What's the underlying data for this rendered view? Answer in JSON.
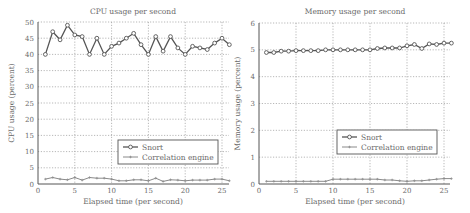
{
  "chart_data": [
    {
      "type": "line",
      "title": "CPU usage per second",
      "xlabel": "Elapsed time (per second)",
      "ylabel": "CPU usage (percent)",
      "xlim": [
        0,
        27
      ],
      "ylim": [
        0,
        50
      ],
      "xticks": [
        0,
        5,
        10,
        15,
        20,
        25
      ],
      "yticks": [
        0,
        5,
        10,
        15,
        20,
        25,
        30,
        35,
        40,
        45,
        50
      ],
      "grid": true,
      "legend_position": "lower center",
      "x": [
        1,
        2,
        3,
        4,
        5,
        6,
        7,
        8,
        9,
        10,
        11,
        12,
        13,
        14,
        15,
        16,
        17,
        18,
        19,
        20,
        21,
        22,
        23,
        24,
        25,
        26
      ],
      "series": [
        {
          "name": "Snort",
          "marker": "circle",
          "values": [
            40,
            47,
            44.5,
            49,
            46,
            45.5,
            40,
            45,
            40,
            42.5,
            43.5,
            45,
            46.5,
            43,
            40,
            45.5,
            41,
            45.5,
            42,
            40,
            42.5,
            42,
            41.5,
            43.5,
            45,
            43
          ]
        },
        {
          "name": "Correlation engine",
          "marker": "plus",
          "values": [
            1.5,
            2,
            1.5,
            1.3,
            2,
            1.2,
            2,
            1.8,
            1.8,
            1.5,
            1,
            1,
            1.3,
            1.3,
            1,
            1.8,
            0.8,
            1.3,
            1.2,
            1,
            1.2,
            1.2,
            1.2,
            1.5,
            1.5,
            1
          ]
        }
      ]
    },
    {
      "type": "line",
      "title": "Memory usage per second",
      "xlabel": "Elapsed time (per second)",
      "ylabel": "Memory usage (percent)",
      "xlim": [
        0,
        27
      ],
      "ylim": [
        0,
        6
      ],
      "xticks": [
        0,
        5,
        10,
        15,
        20,
        25
      ],
      "yticks": [
        0,
        1,
        2,
        3,
        4,
        5,
        6
      ],
      "grid": true,
      "legend_position": "lower center",
      "x": [
        1,
        2,
        3,
        4,
        5,
        6,
        7,
        8,
        9,
        10,
        11,
        12,
        13,
        14,
        15,
        16,
        17,
        18,
        19,
        20,
        21,
        22,
        23,
        24,
        25,
        26
      ],
      "series": [
        {
          "name": "Snort",
          "marker": "circle",
          "values": [
            4.9,
            4.9,
            4.95,
            4.95,
            4.97,
            4.97,
            4.97,
            4.97,
            5,
            5,
            5,
            5,
            5,
            5,
            5,
            5.05,
            5.07,
            5.07,
            5.07,
            5.15,
            5.2,
            5.05,
            5.22,
            5.2,
            5.25,
            5.25
          ]
        },
        {
          "name": "Correlation engine",
          "marker": "plus",
          "values": [
            0.1,
            0.1,
            0.1,
            0.1,
            0.1,
            0.1,
            0.1,
            0.1,
            0.1,
            0.18,
            0.18,
            0.18,
            0.18,
            0.18,
            0.18,
            0.18,
            0.15,
            0.15,
            0.12,
            0.1,
            0.12,
            0.12,
            0.15,
            0.18,
            0.2,
            0.2
          ]
        }
      ]
    }
  ]
}
